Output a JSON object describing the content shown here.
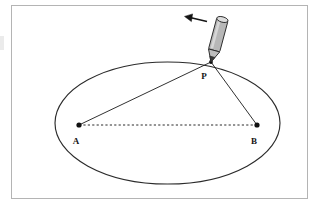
{
  "figure": {
    "frame": {
      "border_color": "#b4b4b4",
      "background_color": "#ffffff",
      "x": 11,
      "y": 5,
      "width": 297,
      "height": 194
    },
    "ellipse": {
      "name": "ellipse-curve",
      "stroke_color": "#2b2b2b",
      "fill": "none",
      "center_x": 167.5,
      "center_y": 123,
      "radius_x": 112.5,
      "radius_y": 61
    },
    "points": [
      {
        "id": "A",
        "label": "A",
        "x": 79,
        "y": 125,
        "label_x": 76,
        "label_y": 144,
        "role": "focus",
        "dot_color": "#111111"
      },
      {
        "id": "B",
        "label": "B",
        "x": 257,
        "y": 125,
        "label_x": 254,
        "label_y": 144,
        "role": "focus",
        "dot_color": "#111111"
      },
      {
        "id": "P",
        "label": "P",
        "x": 211,
        "y": 62,
        "label_x": 204,
        "label_y": 79,
        "role": "tracing-point",
        "dot_color": "#111111"
      }
    ],
    "segments": [
      {
        "id": "AP",
        "from": "A",
        "to": "P",
        "style": "solid",
        "stroke_color": "#1a1a1a"
      },
      {
        "id": "BP",
        "from": "B",
        "to": "P",
        "style": "solid",
        "stroke_color": "#1a1a1a"
      },
      {
        "id": "AB",
        "from": "A",
        "to": "B",
        "style": "dashed",
        "stroke_color": "#2a2a2a"
      }
    ],
    "pencil": {
      "name": "pencil",
      "body_color": "#b7b7b7",
      "outline_color": "#2b2b2b",
      "tip_color": "#3a3a3a",
      "eraser_color": "#d8d8d8",
      "tip_x": 211,
      "tip_y": 62,
      "tilt_degrees": 15
    },
    "motion_arrow": {
      "name": "motion-arrow",
      "direction": "left",
      "color": "#151515",
      "start_x": 207,
      "start_y": 21,
      "end_x": 186,
      "end_y": 17
    }
  }
}
